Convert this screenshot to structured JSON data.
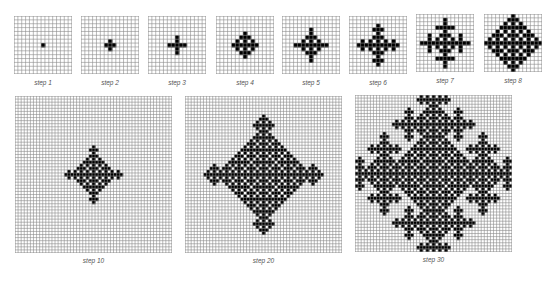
{
  "figure": {
    "rule": "cell turns black if exactly one of its four orthogonal neighbors is black; black cells stay black",
    "colors": {
      "cell_on": "#000000",
      "cell_off": "#ffffff",
      "grid_line": "#8c8c8c"
    },
    "panels": [
      {
        "label": "step 1",
        "steps": 1,
        "cells": 15,
        "x": 14,
        "y": 16,
        "size": 58
      },
      {
        "label": "step 2",
        "steps": 2,
        "cells": 15,
        "x": 81,
        "y": 16,
        "size": 58
      },
      {
        "label": "step 3",
        "steps": 3,
        "cells": 15,
        "x": 148,
        "y": 16,
        "size": 58
      },
      {
        "label": "step 4",
        "steps": 4,
        "cells": 15,
        "x": 216,
        "y": 16,
        "size": 58
      },
      {
        "label": "step 5",
        "steps": 5,
        "cells": 15,
        "x": 282,
        "y": 16,
        "size": 58
      },
      {
        "label": "step 6",
        "steps": 6,
        "cells": 15,
        "x": 349,
        "y": 16,
        "size": 58
      },
      {
        "label": "step 7",
        "steps": 7,
        "cells": 15,
        "x": 416,
        "y": 14,
        "size": 58
      },
      {
        "label": "step 8",
        "steps": 8,
        "cells": 15,
        "x": 484,
        "y": 14,
        "size": 58
      },
      {
        "label": "step 10",
        "steps": 10,
        "cells": 51,
        "x": 15,
        "y": 96,
        "size": 157
      },
      {
        "label": "step 20",
        "steps": 20,
        "cells": 51,
        "x": 185,
        "y": 96,
        "size": 157
      },
      {
        "label": "step 30",
        "steps": 30,
        "cells": 51,
        "x": 355,
        "y": 95,
        "size": 157
      }
    ]
  }
}
